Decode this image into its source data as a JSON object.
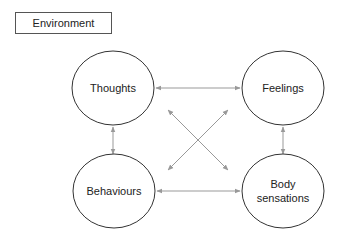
{
  "diagram": {
    "context_box": {
      "label": "Environment"
    },
    "nodes": [
      {
        "id": "thoughts",
        "label_lines": [
          "Thoughts"
        ]
      },
      {
        "id": "feelings",
        "label_lines": [
          "Feelings"
        ]
      },
      {
        "id": "behaviours",
        "label_lines": [
          "Behaviours"
        ]
      },
      {
        "id": "body_sensations",
        "label_lines": [
          "Body",
          "sensations"
        ]
      }
    ],
    "edges": [
      {
        "from": "thoughts",
        "to": "feelings",
        "direction": "bidirectional"
      },
      {
        "from": "thoughts",
        "to": "behaviours",
        "direction": "bidirectional"
      },
      {
        "from": "feelings",
        "to": "body_sensations",
        "direction": "bidirectional"
      },
      {
        "from": "behaviours",
        "to": "body_sensations",
        "direction": "bidirectional"
      },
      {
        "from": "thoughts",
        "to": "body_sensations",
        "direction": "bidirectional"
      },
      {
        "from": "feelings",
        "to": "behaviours",
        "direction": "bidirectional"
      }
    ],
    "colors": {
      "node_stroke": "#333333",
      "arrow": "#999999",
      "text": "#222222"
    }
  }
}
